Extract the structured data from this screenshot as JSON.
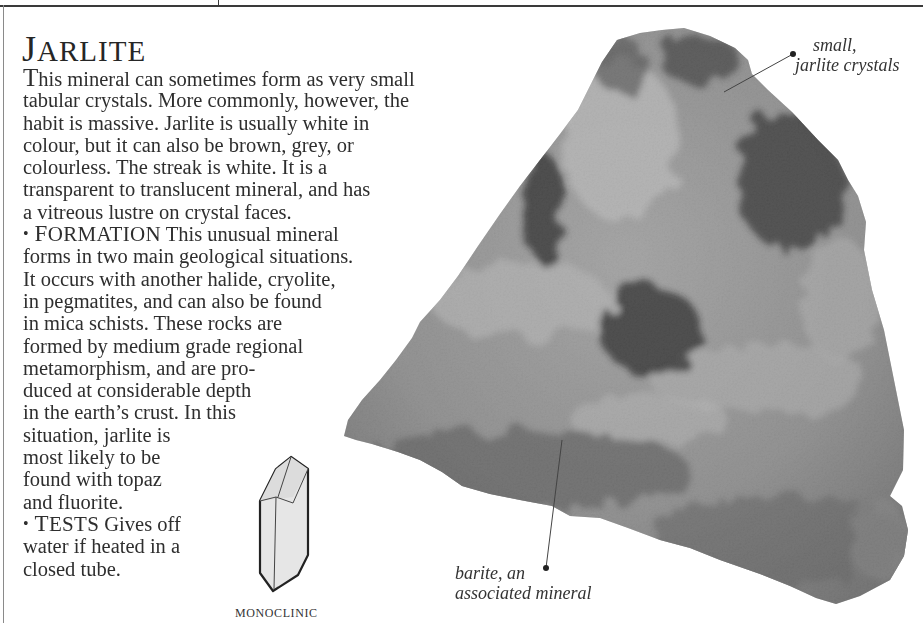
{
  "page": {
    "title_initial": "J",
    "title_rest": "ARLITE",
    "intro_lines": [
      {
        "dropcap": "T",
        "text": "his mineral can sometimes form as very small"
      },
      {
        "text": "tabular crystals. More commonly, however, the"
      },
      {
        "text": "habit is massive. Jarlite is usually white in"
      },
      {
        "text": "colour, but it can also be brown, grey, or"
      },
      {
        "text": "colourless. The streak is white. It is a"
      },
      {
        "text": "transparent to translucent mineral, and has"
      },
      {
        "text": "a vitreous lustre on crystal faces."
      }
    ],
    "formation": {
      "bullet": "•",
      "heading_initial": "F",
      "heading_rest": "ORMATION",
      "first_line": "This unusual mineral",
      "lines": [
        "forms in two main geological situations.",
        "It occurs with another halide, cryolite,",
        "in pegmatites, and can also be found",
        "in mica schists. These rocks are",
        "formed by medium grade regional",
        "metamorphism, and are pro-",
        "duced at considerable depth",
        "in the earth’s crust. In this",
        "situation, jarlite is",
        "most likely to be",
        "found with topaz",
        "and fluorite."
      ]
    },
    "tests": {
      "bullet": "•",
      "heading_initial": "T",
      "heading_rest": "ESTS",
      "first_line": "Gives off",
      "lines": [
        "water if heated in a",
        "closed tube."
      ]
    },
    "callouts": {
      "top_line1": "small,",
      "top_line2": "jarlite crystals",
      "bottom_line1": "barite, an",
      "bottom_line2": "associated mineral"
    },
    "crystal_system": "MONOCLINIC",
    "colors": {
      "text": "#2e2e2e",
      "rule": "#3a3a3a",
      "background": "#ffffff"
    }
  }
}
